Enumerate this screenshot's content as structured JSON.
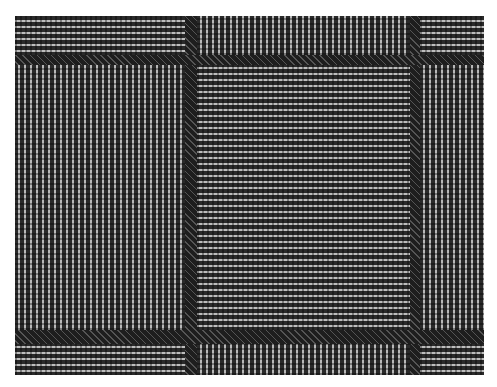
{
  "image": {
    "description": "Grayscale close-up photograph of a woven glen-plaid check fabric",
    "colors": {
      "background": "#ffffff",
      "dark_thread": "#2a2a2a",
      "light_thread": "#bdbdbd"
    },
    "regions": {
      "columns": [
        "vertical-stripe",
        "dark-band",
        "horizontal-stripe",
        "dark-band",
        "vertical-stripe"
      ],
      "rows": [
        "top-band",
        "dark-band",
        "middle",
        "dark-band",
        "bottom-band"
      ]
    }
  }
}
